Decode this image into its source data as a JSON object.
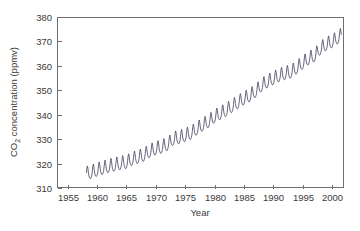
{
  "chart_data": {
    "type": "line",
    "title": "",
    "xlabel": "Year",
    "ylabel": "CO2 concentration (ppmv)",
    "ylabel_prefix": "CO",
    "ylabel_subscript": "2",
    "ylabel_suffix": " concentration (ppmv)",
    "xlim": [
      1953.2,
      2002.0
    ],
    "ylim": [
      310,
      380
    ],
    "grid": false,
    "legend": null,
    "line_color": "#4a4a66",
    "axis_color": "#6e6e6e",
    "text_color": "#3a3a3a",
    "background_color": "#ffffff",
    "xticks": [
      1955,
      1960,
      1965,
      1970,
      1975,
      1980,
      1985,
      1990,
      1995,
      2000
    ],
    "xtick_labels": [
      "1955",
      "1960",
      "1965",
      "1970",
      "1975",
      "1980",
      "1985",
      "1990",
      "1995",
      "2000"
    ],
    "yticks": [
      310,
      320,
      330,
      340,
      350,
      360,
      370,
      380
    ],
    "ytick_labels": [
      "310",
      "320",
      "330",
      "340",
      "350",
      "360",
      "370",
      "380"
    ],
    "series": [
      {
        "name": "Mauna Loa monthly mean CO2",
        "x_start": 1958.21,
        "x_step": 0.0833333,
        "seasonal_amplitude": 3.1,
        "seasonal_peak_month_fraction": 0.37,
        "annual_means_x": [
          1958,
          1959,
          1960,
          1961,
          1962,
          1963,
          1964,
          1965,
          1966,
          1967,
          1968,
          1969,
          1970,
          1971,
          1972,
          1973,
          1974,
          1975,
          1976,
          1977,
          1978,
          1979,
          1980,
          1981,
          1982,
          1983,
          1984,
          1985,
          1986,
          1987,
          1988,
          1989,
          1990,
          1991,
          1992,
          1993,
          1994,
          1995,
          1996,
          1997,
          1998,
          1999,
          2000,
          2001,
          2002
        ],
        "annual_means_y": [
          315.3,
          315.98,
          316.91,
          317.64,
          318.45,
          318.99,
          319.62,
          320.04,
          321.38,
          322.16,
          323.04,
          324.62,
          325.68,
          326.32,
          327.45,
          329.68,
          330.18,
          331.11,
          332.04,
          333.83,
          335.4,
          336.84,
          338.75,
          340.11,
          341.45,
          343.05,
          344.65,
          346.12,
          347.42,
          349.19,
          351.57,
          353.12,
          354.39,
          355.61,
          356.45,
          357.1,
          358.83,
          360.82,
          362.61,
          363.73,
          366.7,
          368.38,
          369.55,
          371.14,
          373.1
        ]
      }
    ],
    "geometry": {
      "plot_left": 57,
      "plot_top": 17,
      "plot_right": 344,
      "plot_bottom": 188,
      "tick_length": 4
    }
  }
}
